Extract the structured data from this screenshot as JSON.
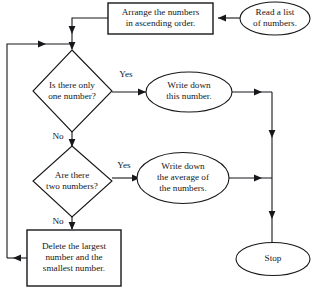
{
  "diagram": {
    "colors": {
      "stroke": "#17171b",
      "fill": "#ffffff",
      "background": "#ffffff"
    },
    "nodes": {
      "read_list": {
        "shape": "oval",
        "role": "start-terminator",
        "line1": "Read a list",
        "line2": "of numbers."
      },
      "arrange": {
        "shape": "rectangle",
        "role": "process",
        "line1": "Arrange the numbers",
        "line2": "in ascending order."
      },
      "decision_one": {
        "shape": "diamond",
        "role": "decision",
        "line1": "Is there only",
        "line2": "one number?"
      },
      "write_number": {
        "shape": "oval",
        "role": "output",
        "line1": "Write down",
        "line2": "this number."
      },
      "decision_two": {
        "shape": "diamond",
        "role": "decision",
        "line1": "Are there",
        "line2": "two numbers?"
      },
      "write_average": {
        "shape": "oval",
        "role": "output",
        "line1": "Write down",
        "line2": "the average of",
        "line3": "the numbers."
      },
      "delete_extremes": {
        "shape": "rectangle",
        "role": "process",
        "line1": "Delete the largest",
        "line2": "number and the",
        "line3": "smallest number."
      },
      "stop": {
        "shape": "oval",
        "role": "end-terminator",
        "line1": "Stop"
      }
    },
    "edge_labels": {
      "decision_one_yes": "Yes",
      "decision_one_no": "No",
      "decision_two_yes": "Yes",
      "decision_two_no": "No"
    }
  }
}
